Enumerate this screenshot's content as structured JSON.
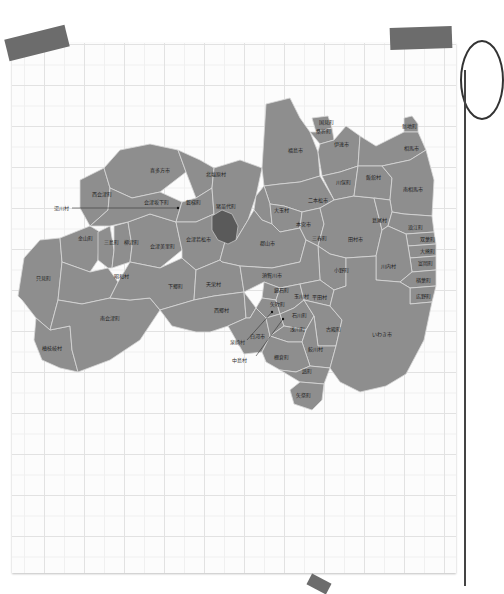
{
  "map": {
    "region": "Fukushima Prefecture",
    "lake_label": "",
    "labels": {
      "fukushima_shi": "福島市",
      "kunimi": "国見町",
      "koori": "桑折町",
      "date": "伊達市",
      "shinchi": "新地町",
      "soma": "相馬市",
      "kawamata": "川俣町",
      "iitate": "飯舘村",
      "minamisoma": "南相馬市",
      "nihonmatsu": "二本松市",
      "otama": "大玉村",
      "motomiya": "本宮市",
      "miharu": "三春町",
      "tamura": "田村市",
      "katsurao": "葛尾村",
      "namie": "浪江町",
      "futaba": "双葉町",
      "okuma": "大熊町",
      "tomioka": "富岡町",
      "kawauchi": "川内村",
      "naraha": "楢葉町",
      "hirono": "広野町",
      "iwaki": "いわき市",
      "ono": "小野町",
      "koriyama": "郡山市",
      "sukagawa": "須賀川市",
      "kagamiishi": "鏡石町",
      "tenei": "天栄村",
      "inawashiro": "猪苗代町",
      "kitashiobara": "北塩原村",
      "kitakata": "喜多方市",
      "nishiaizu": "西会津町",
      "aizubange": "会津坂下町",
      "bandai": "磐梯町",
      "aizuwakamatsu": "会津若松市",
      "yugawa": "湯川村",
      "kaneyama": "金山町",
      "mishima": "三島町",
      "yanaizu": "柳津町",
      "aizumisato": "会津美里町",
      "tadami": "只見町",
      "showa": "昭和村",
      "shimogo": "下郷町",
      "minamiaizu": "南会津町",
      "hinoemata": "檜枝岐村",
      "nishigo": "西郷村",
      "shirakawa": "白河市",
      "izumizaki": "泉崎村",
      "nakajima": "中島村",
      "yabuki": "矢吹町",
      "tamakawa": "玉川村",
      "hirata": "平田村",
      "ishikawa": "石川町",
      "asakawa": "浅川町",
      "furudono": "古殿町",
      "samegawa": "鮫川村",
      "tanagura": "棚倉町",
      "hanawa": "塙町",
      "yamatsuri": "矢祭町"
    }
  }
}
